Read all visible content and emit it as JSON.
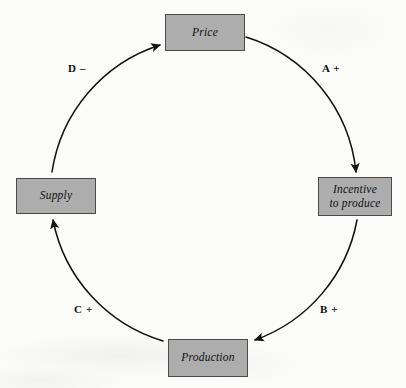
{
  "diagram": {
    "type": "causal-loop",
    "background_color": "#fbfbfa",
    "node_fill_color": "#adadad",
    "node_border_color": "#4a4a4a",
    "stroke_color": "#111111",
    "nodes": [
      {
        "id": "price",
        "label": "Price",
        "position": "top"
      },
      {
        "id": "incentive",
        "label": "Incentive\nto produce",
        "position": "right"
      },
      {
        "id": "production",
        "label": "Production",
        "position": "bottom"
      },
      {
        "id": "supply",
        "label": "Supply",
        "position": "left"
      }
    ],
    "edges": [
      {
        "id": "a",
        "label": "A +",
        "from": "price",
        "to": "incentive",
        "polarity": "+",
        "arc": "top-right"
      },
      {
        "id": "b",
        "label": "B +",
        "from": "incentive",
        "to": "production",
        "polarity": "+",
        "arc": "bottom-right"
      },
      {
        "id": "c",
        "label": "C +",
        "from": "production",
        "to": "supply",
        "polarity": "+",
        "arc": "bottom-left"
      },
      {
        "id": "d",
        "label": "D –",
        "from": "supply",
        "to": "price",
        "polarity": "–",
        "arc": "top-left"
      }
    ]
  }
}
